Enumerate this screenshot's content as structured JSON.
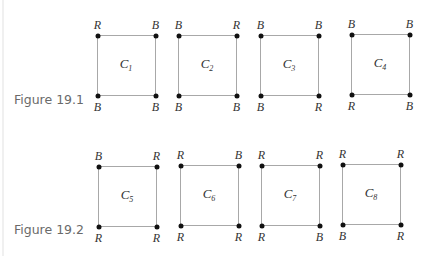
{
  "figures": [
    {
      "label": "Figure 19.1",
      "label_pos": {
        "x": 14,
        "y": 92
      },
      "squares": [
        {
          "name": "C",
          "sub": "1",
          "x1": 97,
          "y1": 35,
          "x2": 155,
          "y2": 95,
          "tl": "R",
          "tr": "B",
          "bl": "B",
          "br": "B"
        },
        {
          "name": "C",
          "sub": "2",
          "x1": 178,
          "y1": 35,
          "x2": 236,
          "y2": 95,
          "tl": "B",
          "tr": "R",
          "bl": "B",
          "br": "B"
        },
        {
          "name": "C",
          "sub": "3",
          "x1": 260,
          "y1": 35,
          "x2": 318,
          "y2": 95,
          "tl": "B",
          "tr": "B",
          "bl": "B",
          "br": "R"
        },
        {
          "name": "C",
          "sub": "4",
          "x1": 351,
          "y1": 34,
          "x2": 409,
          "y2": 94,
          "tl": "B",
          "tr": "B",
          "bl": "R",
          "br": "B"
        }
      ]
    },
    {
      "label": "Figure 19.2",
      "label_pos": {
        "x": 14,
        "y": 222
      },
      "squares": [
        {
          "name": "C",
          "sub": "5",
          "x1": 98,
          "y1": 166,
          "x2": 156,
          "y2": 226,
          "tl": "B",
          "tr": "R",
          "bl": "R",
          "br": "R"
        },
        {
          "name": "C",
          "sub": "6",
          "x1": 180,
          "y1": 165,
          "x2": 238,
          "y2": 225,
          "tl": "R",
          "tr": "B",
          "bl": "R",
          "br": "R"
        },
        {
          "name": "C",
          "sub": "7",
          "x1": 261,
          "y1": 165,
          "x2": 319,
          "y2": 225,
          "tl": "R",
          "tr": "R",
          "bl": "R",
          "br": "B"
        },
        {
          "name": "C",
          "sub": "8",
          "x1": 342,
          "y1": 164,
          "x2": 400,
          "y2": 224,
          "tl": "R",
          "tr": "R",
          "bl": "B",
          "br": "R"
        }
      ]
    }
  ]
}
